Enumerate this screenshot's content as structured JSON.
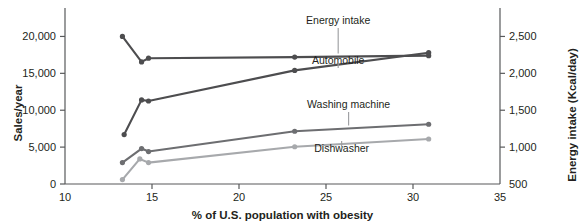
{
  "chart_data": {
    "type": "line",
    "title": "",
    "xlabel": "% of U.S. population with obesity",
    "ylabel": "Sales/year",
    "y2label": "Energy intake (Kcal/day)",
    "xlim": [
      10,
      35
    ],
    "ylim": [
      0,
      22500
    ],
    "y2lim": [
      500,
      2750
    ],
    "xticks": [
      10,
      15,
      20,
      25,
      30,
      35
    ],
    "xticklabels": [
      "10",
      "15",
      "20",
      "25",
      "30",
      "35"
    ],
    "yticks": [
      0,
      5000,
      10000,
      15000,
      20000
    ],
    "yticklabels": [
      "0",
      "5,000",
      "10,000",
      "15,000",
      "20,000"
    ],
    "y2ticks": [
      500,
      1000,
      1500,
      2000,
      2500
    ],
    "y2ticklabels": [
      "500",
      "1,000",
      "1,500",
      "2,000",
      "2,500"
    ],
    "grid": false,
    "legend_position": "inline-labels",
    "series": [
      {
        "name": "Energy intake",
        "axis": "right",
        "color": "#4d4d4f",
        "x": [
          13.3,
          14.4,
          14.8,
          23.2,
          30.9
        ],
        "y": [
          2500,
          2155,
          2205,
          2220,
          2240
        ],
        "label_x": 25.7,
        "label_y_px": 24
      },
      {
        "name": "Automobile",
        "axis": "left",
        "color": "#4d4d4f",
        "x": [
          13.4,
          14.4,
          14.8,
          23.2,
          30.9
        ],
        "y": [
          6700,
          11400,
          11250,
          15400,
          17800
        ],
        "label_x": 25.7,
        "label_y_px": 64
      },
      {
        "name": "Washing machine",
        "axis": "left",
        "color": "#6d6e71",
        "x": [
          13.3,
          14.4,
          14.8,
          23.2,
          30.9
        ],
        "y": [
          2900,
          4800,
          4400,
          7150,
          8100
        ],
        "label_x": 26.3,
        "label_y_px": 108
      },
      {
        "name": "Dishwasher",
        "axis": "left",
        "color": "#a7a9ac",
        "x": [
          13.3,
          14.3,
          14.8,
          23.2,
          30.9
        ],
        "y": [
          600,
          3400,
          2900,
          5050,
          6100
        ],
        "label_x": 25.9,
        "label_y_px": 152
      }
    ]
  },
  "colors": {
    "axis": "#58595b",
    "text": "#231f20",
    "leader": "#9a9b9e",
    "background": "#ffffff"
  }
}
